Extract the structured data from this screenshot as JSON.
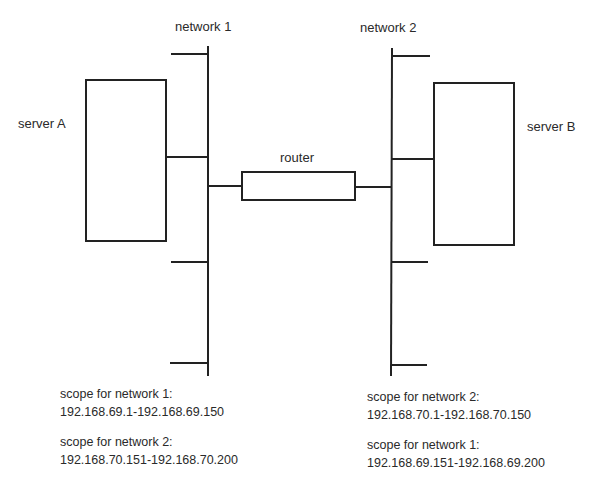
{
  "diagram": {
    "nodes": {
      "network1": {
        "label": "network 1"
      },
      "network2": {
        "label": "network 2"
      },
      "serverA": {
        "label": "server A"
      },
      "serverB": {
        "label": "server B"
      },
      "router": {
        "label": "router"
      }
    },
    "scopes_left": [
      {
        "title": "scope for network 1:",
        "range": "192.168.69.1-192.168.69.150"
      },
      {
        "title": "scope for network 2:",
        "range": "192.168.70.151-192.168.70.200"
      }
    ],
    "scopes_right": [
      {
        "title": "scope for network 2:",
        "range": "192.168.70.1-192.168.70.150"
      },
      {
        "title": "scope for network 1:",
        "range": "192.168.69.151-192.168.69.200"
      }
    ],
    "edges": [
      {
        "from": "serverA",
        "to": "network1"
      },
      {
        "from": "network1",
        "to": "router"
      },
      {
        "from": "router",
        "to": "network2"
      },
      {
        "from": "network2",
        "to": "serverB"
      }
    ],
    "line_color": "#222222"
  }
}
